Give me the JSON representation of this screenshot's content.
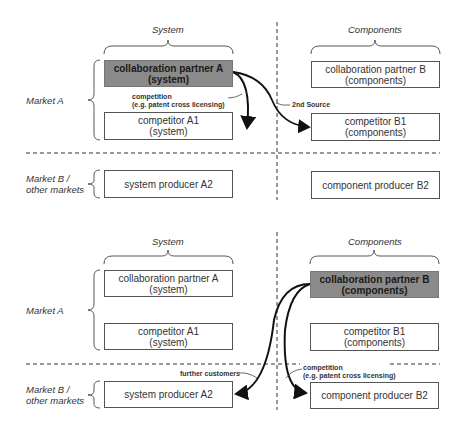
{
  "panels": [
    {
      "column_labels": {
        "system": "System",
        "components": "Components"
      },
      "row_labels": {
        "market_a": "Market A",
        "market_b": "Market B / other markets"
      },
      "boxes": {
        "partner_a": {
          "line1": "collaboration partner A",
          "line2": "(system)",
          "highlighted": true
        },
        "competitor_a1": {
          "line1": "competitor A1",
          "line2": "(system)"
        },
        "producer_a2": {
          "line1": "system producer A2"
        },
        "partner_b": {
          "line1": "collaboration partner B",
          "line2": "(components)",
          "highlighted": false
        },
        "competitor_b1": {
          "line1": "competitor B1",
          "line2": "(components)"
        },
        "producer_b2": {
          "line1": "component producer B2"
        }
      },
      "annotations": {
        "competition_line1": "competition",
        "competition_line2": "(e.g. patent cross licensing)",
        "second_source": "2nd Source"
      }
    },
    {
      "column_labels": {
        "system": "System",
        "components": "Components"
      },
      "row_labels": {
        "market_a": "Market A",
        "market_b": "Market B / other markets"
      },
      "boxes": {
        "partner_a": {
          "line1": "collaboration partner A",
          "line2": "(system)",
          "highlighted": false
        },
        "competitor_a1": {
          "line1": "competitor A1",
          "line2": "(system)"
        },
        "producer_a2": {
          "line1": "system producer A2"
        },
        "partner_b": {
          "line1": "collaboration partner B",
          "line2": "(components)",
          "highlighted": true
        },
        "competitor_b1": {
          "line1": "competitor B1",
          "line2": "(components)"
        },
        "producer_b2": {
          "line1": "component producer B2"
        }
      },
      "annotations": {
        "further_customers": "further customers",
        "competition_line1": "competition",
        "competition_line2": "(e.g. patent cross licensing)"
      }
    }
  ],
  "colors": {
    "highlight_fill": "#8a8a8a",
    "line": "#333333"
  }
}
